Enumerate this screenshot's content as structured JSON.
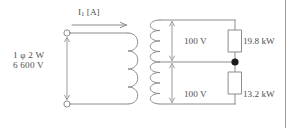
{
  "diagram": {
    "source": {
      "line1": "1 φ 2 W",
      "line2": "6 600 V",
      "terminal_count": 2,
      "arrow": "double-headed-vertical"
    },
    "current": {
      "symbol": "I",
      "subscript": "1",
      "unit": "[A]",
      "arrow": "right"
    },
    "secondary": {
      "upper_voltage": "100 V",
      "lower_voltage": "100 V",
      "center_tap": true
    },
    "loads": [
      {
        "position": "upper",
        "power": "19.8 kW"
      },
      {
        "position": "lower",
        "power": "13.2 kW"
      }
    ],
    "colors": {
      "wire": "#8c8c8c",
      "text": "#4f4f4f",
      "node": "#1a1a1a",
      "border": "#9a9a9a",
      "background": "#ffffff"
    }
  }
}
